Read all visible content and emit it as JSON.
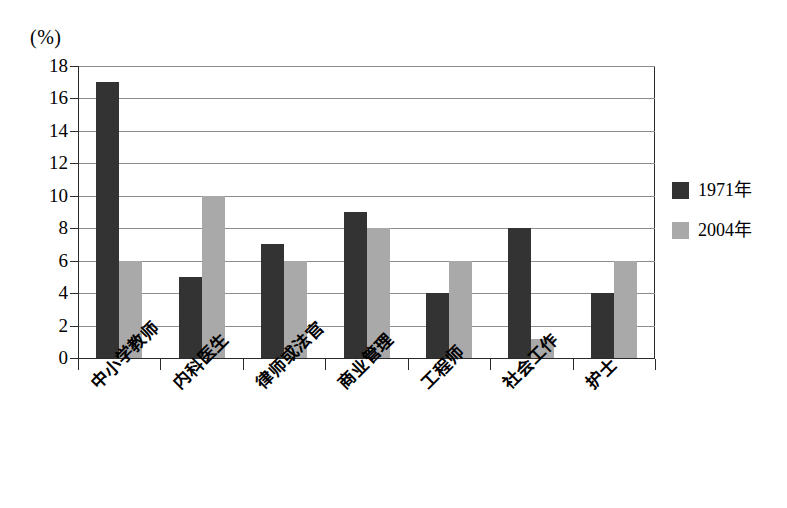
{
  "chart_data": {
    "type": "bar",
    "title": "",
    "subtitle": "",
    "unit_label": "(%)",
    "xlabel": "",
    "ylabel": "",
    "ylim": [
      0,
      18
    ],
    "ytick_step": 2,
    "yticks": [
      18,
      16,
      14,
      12,
      10,
      8,
      6,
      4,
      2,
      0
    ],
    "grid": true,
    "grid_axis": "y",
    "legend_position": "right",
    "categories": [
      "中小学教师",
      "内科医生",
      "律师或法官",
      "商业管理",
      "工程师",
      "社会工作",
      "护士"
    ],
    "series": [
      {
        "name": "1971年",
        "color": "#333333",
        "values": [
          17,
          5,
          7,
          9,
          4,
          8,
          4
        ]
      },
      {
        "name": "2004年",
        "color": "#a9a9a9",
        "values": [
          6,
          10,
          6,
          8,
          6,
          1.2,
          6
        ]
      }
    ]
  },
  "legend": {
    "items": [
      {
        "label": "1971年",
        "swatch": "dark-square-swatch"
      },
      {
        "label": "2004年",
        "swatch": "gray-square-swatch"
      }
    ]
  },
  "colors": {
    "series_1": "#333333",
    "series_2": "#a9a9a9",
    "axis": "#2b2b2b",
    "gridline": "#8d8d8d",
    "background": "#ffffff"
  }
}
